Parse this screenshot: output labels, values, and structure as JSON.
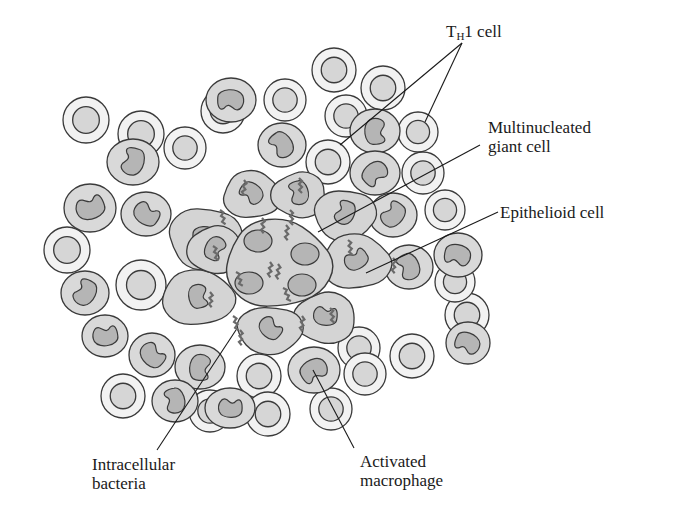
{
  "figure": {
    "colors": {
      "background": "#ffffff",
      "outline": "#3a3a3a",
      "th1_cytoplasm": "#f2f2f2",
      "th1_nucleus": "#d6d6d6",
      "macrophage_cytoplasm": "#d9d9d9",
      "macrophage_nucleus": "#b5b5b5",
      "giant_cell": "#d4d4d4",
      "bacteria": "#6a6a6a",
      "leader": "#1a1a1a"
    }
  },
  "labels": {
    "th1": {
      "prefix": "T",
      "subscript": "H",
      "suffix": "1 cell"
    },
    "giant_line1": "Multinucleated",
    "giant_line2": "giant cell",
    "epithelioid": "Epithelioid cell",
    "bacteria_line1": "Intracellular",
    "bacteria_line2": "bacteria",
    "macrophage_line1": "Activated",
    "macrophage_line2": "macrophage"
  },
  "cells": {
    "th1": [
      [
        334,
        70,
        22
      ],
      [
        383,
        88,
        22
      ],
      [
        285,
        100,
        21
      ],
      [
        223,
        111,
        22
      ],
      [
        86,
        120,
        23
      ],
      [
        346,
        116,
        21
      ],
      [
        141,
        134,
        23
      ],
      [
        185,
        148,
        21
      ],
      [
        328,
        162,
        22
      ],
      [
        418,
        132,
        20
      ],
      [
        423,
        173,
        21
      ],
      [
        445,
        210,
        20
      ],
      [
        67,
        250,
        23
      ],
      [
        141,
        285,
        25
      ],
      [
        123,
        396,
        22
      ],
      [
        259,
        376,
        22
      ],
      [
        359,
        348,
        21
      ],
      [
        412,
        356,
        22
      ],
      [
        467,
        315,
        22
      ],
      [
        455,
        282,
        20
      ],
      [
        210,
        411,
        21
      ],
      [
        268,
        414,
        22
      ],
      [
        331,
        409,
        21
      ],
      [
        365,
        374,
        21
      ]
    ],
    "macrophages": [
      [
        231,
        100,
        25,
        22
      ],
      [
        282,
        145,
        24,
        22
      ],
      [
        133,
        162,
        26,
        23
      ],
      [
        90,
        208,
        26,
        24
      ],
      [
        146,
        214,
        25,
        22
      ],
      [
        375,
        131,
        25,
        22
      ],
      [
        375,
        173,
        25,
        22
      ],
      [
        458,
        255,
        24,
        22
      ],
      [
        409,
        267,
        24,
        22
      ],
      [
        85,
        293,
        24,
        22
      ],
      [
        105,
        336,
        23,
        21
      ],
      [
        152,
        355,
        23,
        22
      ],
      [
        200,
        367,
        25,
        22
      ],
      [
        314,
        370,
        26,
        23
      ],
      [
        468,
        343,
        22,
        21
      ],
      [
        175,
        401,
        23,
        21
      ],
      [
        393,
        215,
        24,
        22
      ],
      [
        230,
        408,
        25,
        20
      ]
    ],
    "epithelioid": [
      [
        205,
        238,
        40,
        34
      ],
      [
        252,
        195,
        32,
        26
      ],
      [
        299,
        195,
        30,
        25
      ],
      [
        345,
        215,
        34,
        28
      ],
      [
        356,
        262,
        38,
        30
      ],
      [
        325,
        318,
        34,
        28
      ],
      [
        270,
        330,
        36,
        26
      ],
      [
        198,
        298,
        40,
        30
      ],
      [
        215,
        250,
        30,
        26
      ]
    ],
    "giant": {
      "cx": 278,
      "cy": 264,
      "rx": 58,
      "ry": 48,
      "nuclei": [
        [
          258,
          241,
          14,
          11
        ],
        [
          305,
          254,
          14,
          11
        ],
        [
          249,
          283,
          14,
          11
        ],
        [
          302,
          285,
          14,
          11
        ]
      ]
    }
  },
  "leaders": [
    {
      "name": "th1-leader-a",
      "x1": 462,
      "y1": 43,
      "x2": 340,
      "y2": 145
    },
    {
      "name": "th1-leader-b",
      "x1": 462,
      "y1": 43,
      "x2": 425,
      "y2": 122
    },
    {
      "name": "giant-leader",
      "x1": 480,
      "y1": 145,
      "x2": 318,
      "y2": 232
    },
    {
      "name": "epithelioid-leader",
      "x1": 498,
      "y1": 212,
      "x2": 366,
      "y2": 273
    },
    {
      "name": "bacteria-leader",
      "x1": 157,
      "y1": 450,
      "x2": 236,
      "y2": 330
    },
    {
      "name": "macrophage-leader",
      "x1": 354,
      "y1": 448,
      "x2": 313,
      "y2": 370
    }
  ]
}
